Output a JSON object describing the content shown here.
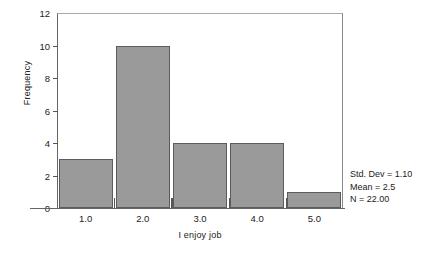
{
  "chart_data": {
    "type": "bar",
    "title": "",
    "xlabel": "I enjoy job",
    "ylabel": "Frequency",
    "categories": [
      "1.0",
      "2.0",
      "3.0",
      "4.0",
      "5.0"
    ],
    "values": [
      3,
      10,
      4,
      4,
      1
    ],
    "ylim": [
      0,
      12
    ],
    "y_ticks": [
      0,
      2,
      4,
      6,
      8,
      10,
      12
    ],
    "y_tick_labels": [
      "0",
      "2",
      "4",
      "6",
      "8",
      "10",
      "12"
    ],
    "x_tick_labels": [
      "1.0",
      "2.0",
      "3.0",
      "4.0",
      "5.0"
    ],
    "grid": false,
    "legend": false,
    "bar_color": "#9a9a9a",
    "bar_border_color": "#5c5c5c",
    "background_color": "#ffffff",
    "axis_color": "#666666",
    "annotations": [
      "Std. Dev = 1.10",
      "Mean = 2.5",
      "N = 22.00"
    ]
  },
  "statistics": {
    "std_dev_line": "Std. Dev = 1.10",
    "mean_line": "Mean = 2.5",
    "n_line": "N = 22.00"
  },
  "axes": {
    "y_title": "Frequency",
    "x_title": "I enjoy job"
  }
}
